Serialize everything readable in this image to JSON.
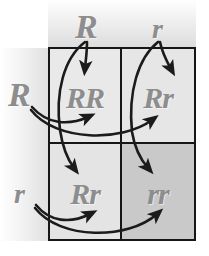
{
  "diagram": {
    "type": "punnett-square",
    "colors": {
      "grid_line": "#161616",
      "allele_text": "#8d8d8d",
      "arrow": "#1b1b1b",
      "cell_light": "#e9e9e9",
      "cell_mid": "#e4e4e4",
      "cell_dark": "#c9c9c9",
      "background": "#ffffff"
    },
    "column_headers": [
      {
        "id": "col-allele-R",
        "label": "R"
      },
      {
        "id": "col-allele-r",
        "label": "r"
      }
    ],
    "row_headers": [
      {
        "id": "row-allele-R",
        "label": "R"
      },
      {
        "id": "row-allele-r",
        "label": "r"
      }
    ],
    "cells": [
      {
        "id": "cell-RR",
        "label": "RR",
        "row": 1,
        "col": 1,
        "fill": "#e9e9e9"
      },
      {
        "id": "cell-Rr-top",
        "label": "Rr",
        "row": 1,
        "col": 2,
        "fill": "#e6e6e6"
      },
      {
        "id": "cell-Rr-bottom",
        "label": "Rr",
        "row": 2,
        "col": 1,
        "fill": "#e4e4e4"
      },
      {
        "id": "cell-rr",
        "label": "rr",
        "row": 2,
        "col": 2,
        "fill": "#c9c9c9"
      }
    ],
    "arrows": [
      {
        "id": "arrow-colR-to-RR",
        "from": "col-allele-R",
        "to": "cell-RR"
      },
      {
        "id": "arrow-colR-to-Rr-bottom",
        "from": "col-allele-R",
        "to": "cell-Rr-bottom"
      },
      {
        "id": "arrow-colr-to-Rr-top",
        "from": "col-allele-r",
        "to": "cell-Rr-top"
      },
      {
        "id": "arrow-colr-to-rr",
        "from": "col-allele-r",
        "to": "cell-rr"
      },
      {
        "id": "arrow-rowR-to-RR",
        "from": "row-allele-R",
        "to": "cell-RR"
      },
      {
        "id": "arrow-rowR-to-Rr-top",
        "from": "row-allele-R",
        "to": "cell-Rr-top"
      },
      {
        "id": "arrow-rowr-to-Rr-bottom",
        "from": "row-allele-r",
        "to": "cell-Rr-bottom"
      },
      {
        "id": "arrow-rowr-to-rr",
        "from": "row-allele-r",
        "to": "cell-rr"
      }
    ]
  }
}
